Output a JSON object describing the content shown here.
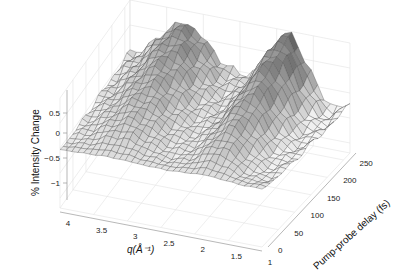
{
  "chart_data": {
    "type": "surface3d",
    "title": "",
    "xlabel": "q(Å⁻¹)",
    "ylabel": "Pump-probe delay (fs)",
    "zlabel": "% Intensity Change",
    "x_ticks": [
      "4",
      "3.5",
      "3",
      "2.5",
      "2",
      "1.5",
      "1"
    ],
    "x_tick_values": [
      4,
      3.5,
      3,
      2.5,
      2,
      1.5,
      1
    ],
    "y_ticks": [
      "0",
      "50",
      "100",
      "150",
      "200",
      "250"
    ],
    "y_tick_values": [
      0,
      50,
      100,
      150,
      200,
      250
    ],
    "z_ticks": [
      "0.5",
      "0",
      "−0.5",
      "−1"
    ],
    "z_tick_values": [
      0.5,
      0,
      -0.5,
      -1
    ],
    "xlim": [
      1,
      4.2
    ],
    "ylim": [
      0,
      270
    ],
    "zlim": [
      -1.2,
      1.0
    ],
    "grid": true,
    "colormap": "gray",
    "surface_description": "Mesh surface with two ridges: a broad hump near q≈3.2 Å⁻¹ and a sharper, taller peak near q≈1.8 Å⁻¹; both grow with delay, reaching ≈0.9% at ~250 fs. Front edge (delay 0) near 0%. Steep drop toward q≈1 at large delay.",
    "peaks": [
      {
        "q": 3.2,
        "delay": 230,
        "z": 0.75
      },
      {
        "q": 1.8,
        "delay": 250,
        "z": 0.95
      }
    ]
  },
  "labels": {
    "zlabel": "% Intensity Change",
    "xlabel": "q(Å⁻¹)",
    "ylabel": "Pump-probe delay (fs)"
  }
}
